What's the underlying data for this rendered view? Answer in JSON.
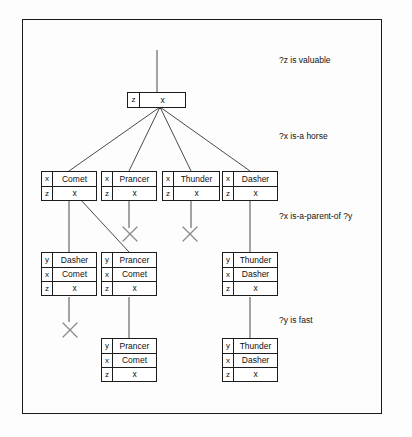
{
  "diagram": {
    "frame": {
      "x": 22,
      "y": 19,
      "w": 360,
      "h": 395,
      "border_color": "#1a1a1a"
    },
    "colors": {
      "ink": "#111111",
      "line": "#444444",
      "box_border": "#1c1c1c",
      "background": "#ffffff"
    },
    "condition_labels": [
      {
        "id": "cond-z-valuable",
        "text": "?z is valuable",
        "x": 279,
        "y": 55
      },
      {
        "id": "cond-x-horse",
        "text": "?x is-a horse",
        "x": 279,
        "y": 131
      },
      {
        "id": "cond-x-parent",
        "text": "?x is-a-parent-of ?y",
        "x": 279,
        "y": 211
      },
      {
        "id": "cond-y-fast",
        "text": "?y is fast",
        "x": 279,
        "y": 315
      }
    ],
    "nodes": [
      {
        "id": "root",
        "name": "token-root",
        "x": 127,
        "y": 92,
        "w": 59,
        "rows": [
          {
            "var": "z",
            "val": "x"
          }
        ]
      },
      {
        "id": "n-comet",
        "name": "token-comet",
        "x": 41,
        "y": 171,
        "w": 56,
        "rows": [
          {
            "var": "x",
            "val": "Comet"
          },
          {
            "var": "z",
            "val": "x"
          }
        ]
      },
      {
        "id": "n-prancer",
        "name": "token-prancer",
        "x": 101,
        "y": 171,
        "w": 56,
        "rows": [
          {
            "var": "x",
            "val": "Prancer"
          },
          {
            "var": "z",
            "val": "x"
          }
        ]
      },
      {
        "id": "n-thunder",
        "name": "token-thunder",
        "x": 162,
        "y": 171,
        "w": 58,
        "rows": [
          {
            "var": "x",
            "val": "Thunder"
          },
          {
            "var": "z",
            "val": "x"
          }
        ]
      },
      {
        "id": "n-dasher",
        "name": "token-dasher",
        "x": 222,
        "y": 171,
        "w": 56,
        "rows": [
          {
            "var": "x",
            "val": "Dasher"
          },
          {
            "var": "z",
            "val": "x"
          }
        ]
      },
      {
        "id": "n-dasher-comet",
        "name": "token-dasher-comet",
        "x": 41,
        "y": 252,
        "w": 56,
        "rows": [
          {
            "var": "y",
            "val": "Dasher"
          },
          {
            "var": "x",
            "val": "Comet"
          },
          {
            "var": "z",
            "val": "x"
          }
        ]
      },
      {
        "id": "n-prancer-comet",
        "name": "token-prancer-comet",
        "x": 101,
        "y": 252,
        "w": 56,
        "rows": [
          {
            "var": "y",
            "val": "Prancer"
          },
          {
            "var": "x",
            "val": "Comet"
          },
          {
            "var": "z",
            "val": "x"
          }
        ]
      },
      {
        "id": "n-thunder-dasher",
        "name": "token-thunder-dasher",
        "x": 222,
        "y": 252,
        "w": 56,
        "rows": [
          {
            "var": "y",
            "val": "Thunder"
          },
          {
            "var": "x",
            "val": "Dasher"
          },
          {
            "var": "z",
            "val": "x"
          }
        ]
      },
      {
        "id": "n-prancer-comet-fast",
        "name": "token-prancer-comet-fast",
        "x": 101,
        "y": 338,
        "w": 56,
        "rows": [
          {
            "var": "y",
            "val": "Prancer"
          },
          {
            "var": "x",
            "val": "Comet"
          },
          {
            "var": "z",
            "val": "x"
          }
        ]
      },
      {
        "id": "n-thunder-dasher-fast",
        "name": "token-thunder-dasher-fast",
        "x": 222,
        "y": 338,
        "w": 56,
        "rows": [
          {
            "var": "y",
            "val": "Thunder"
          },
          {
            "var": "x",
            "val": "Dasher"
          },
          {
            "var": "z",
            "val": "x"
          }
        ]
      }
    ],
    "edges": [
      {
        "id": "e-top-stem",
        "from": [
          157,
          50
        ],
        "to": [
          157,
          92
        ]
      },
      {
        "id": "e-root-comet",
        "from": [
          160,
          107
        ],
        "to": [
          69,
          171
        ]
      },
      {
        "id": "e-root-prancer",
        "from": [
          160,
          107
        ],
        "to": [
          129,
          171
        ]
      },
      {
        "id": "e-root-thunder",
        "from": [
          160,
          107
        ],
        "to": [
          191,
          171
        ]
      },
      {
        "id": "e-root-dasher",
        "from": [
          160,
          107
        ],
        "to": [
          250,
          171
        ]
      },
      {
        "id": "e-comet-down",
        "from": [
          69,
          199
        ],
        "to": [
          69,
          252
        ]
      },
      {
        "id": "e-comet-diag",
        "from": [
          80,
          199
        ],
        "to": [
          129,
          252
        ]
      },
      {
        "id": "e-prancer-down",
        "from": [
          129,
          199
        ],
        "to": [
          129,
          228
        ]
      },
      {
        "id": "e-thunder-down",
        "from": [
          191,
          199
        ],
        "to": [
          191,
          228
        ]
      },
      {
        "id": "e-dasher-down",
        "from": [
          250,
          199
        ],
        "to": [
          250,
          252
        ]
      },
      {
        "id": "e-dc-down",
        "from": [
          69,
          297
        ],
        "to": [
          69,
          322
        ]
      },
      {
        "id": "e-pc-down",
        "from": [
          129,
          297
        ],
        "to": [
          129,
          338
        ]
      },
      {
        "id": "e-td-down",
        "from": [
          250,
          297
        ],
        "to": [
          250,
          338
        ]
      }
    ],
    "pruned_marks": [
      {
        "id": "x-prancer",
        "name": "prune-x-prancer",
        "cx": 130,
        "cy": 234,
        "r": 7
      },
      {
        "id": "x-thunder",
        "name": "prune-x-thunder",
        "cx": 190,
        "cy": 234,
        "r": 7
      },
      {
        "id": "x-dasher-comet",
        "name": "prune-x-dasher-comet",
        "cx": 70,
        "cy": 330,
        "r": 7
      }
    ]
  }
}
